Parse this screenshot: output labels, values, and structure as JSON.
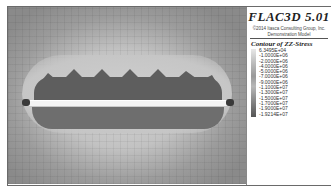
{
  "app": {
    "title": "FLAC3D 5.01",
    "copyright": "©2014 Itasca Consulting Group, Inc.",
    "subtitle": "Demonstration Model"
  },
  "legend": {
    "title": "Contour of ZZ-Stress",
    "values": [
      "6.3495E+04",
      "-1.0000E+06",
      "-2.0000E+06",
      "-4.0000E+06",
      "-5.0000E+06",
      "-7.0000E+06",
      "-9.0000E+06",
      "-1.1000E+07",
      "-1.3000E+07",
      "-1.5000E+07",
      "-1.7000E+07",
      "-1.9000E+07",
      "-1.9214E+07"
    ]
  },
  "colors": {
    "background": "#ffffff",
    "frame": "#6a6a6a",
    "beam": "#f4f4f4",
    "high_stress": "#5e5e5e"
  }
}
